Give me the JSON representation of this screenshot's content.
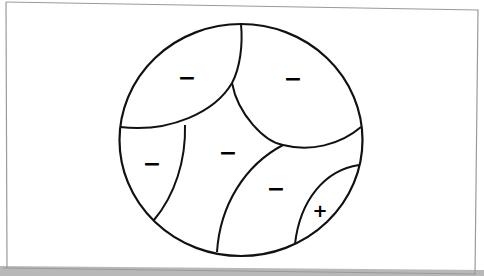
{
  "diagram": {
    "type": "partitioned-circle",
    "colors": {
      "background": "#ffffff",
      "stroke": "#111111",
      "frame": "#9a9a9a",
      "shadow": "#b8b8b8"
    },
    "regions": [
      {
        "id": "top-left",
        "sign": "−"
      },
      {
        "id": "top-right",
        "sign": "−"
      },
      {
        "id": "left",
        "sign": "−"
      },
      {
        "id": "center",
        "sign": "−"
      },
      {
        "id": "lower-right",
        "sign": "−"
      },
      {
        "id": "bottom-right-lens",
        "sign": "+"
      }
    ]
  }
}
